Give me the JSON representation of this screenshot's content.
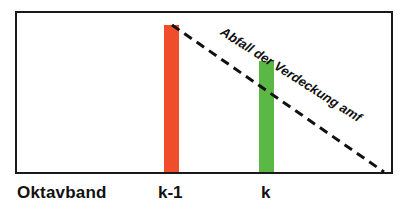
{
  "diagram": {
    "frame": {
      "x": 15,
      "y": 11,
      "w": 376,
      "h": 161,
      "stroke": "#1a1a1a"
    },
    "axis_title": "Oktavband",
    "bars": [
      {
        "id": "k-1",
        "label": "k-1",
        "x": 164,
        "top": 25,
        "bottom": 172,
        "width": 15,
        "color": "#F04E2A",
        "label_x": 158
      },
      {
        "id": "k",
        "label": "k",
        "x": 259,
        "top": 61,
        "bottom": 172,
        "width": 15,
        "color": "#5CB845",
        "label_x": 261
      }
    ],
    "slope_line": {
      "x1": 172,
      "y1": 25,
      "x2": 384,
      "y2": 172,
      "style": "dashed",
      "color": "#111111"
    },
    "slope_label": "Abfall der Verdeckung amf"
  },
  "chart_data": {
    "type": "bar",
    "categories": [
      "k-1",
      "k"
    ],
    "values": [
      100,
      75
    ],
    "xlabel": "Oktavband",
    "ylabel": "",
    "annotations": [
      "Abfall der Verdeckung amf (dashed decay line from top of k-1 bar to baseline)"
    ],
    "grid": false
  }
}
